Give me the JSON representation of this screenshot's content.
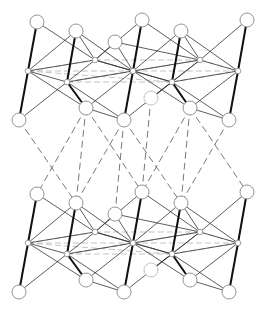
{
  "figure": {
    "caption": "",
    "colors": {
      "background": "#ffffff",
      "bond_solid": "#333333",
      "bond_thick": "#111111",
      "bond_dashed_intra": "#aaaaaa",
      "bond_dashed_inter": "#555555",
      "atom_outline": "#888888",
      "atom_fill": "#ffffff"
    },
    "legend": [],
    "layers": [
      {
        "name": "upper-layer"
      },
      {
        "name": "lower-layer"
      }
    ]
  }
}
